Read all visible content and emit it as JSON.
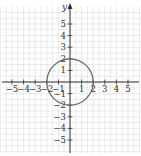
{
  "chart_data": {
    "type": "line",
    "title": "",
    "xlabel": "",
    "ylabel": "y",
    "xlim": [
      -6,
      6
    ],
    "ylim": [
      -6,
      6
    ],
    "grid": true,
    "x_ticks": [
      -5,
      -4,
      -3,
      -2,
      -1,
      1,
      2,
      3,
      4,
      5
    ],
    "y_ticks": [
      5,
      4,
      3,
      2,
      1,
      -1,
      -2,
      -3,
      -4,
      -5
    ],
    "x_tick_labels": [
      "−5",
      "−4",
      "−3",
      "−2",
      "−1",
      "1",
      "2",
      "3",
      "4",
      "5"
    ],
    "y_tick_labels": [
      "5",
      "4",
      "3",
      "2",
      "1",
      "−1",
      "−2",
      "−3",
      "−4",
      "−5"
    ],
    "series": [
      {
        "name": "circle x^2 + y^2 = 4",
        "shape": "circle",
        "center": [
          0,
          0
        ],
        "radius": 2
      }
    ],
    "legend": null
  },
  "colors": {
    "grid": "#dcdcdc",
    "axis": "#333333",
    "curve": "#666666"
  }
}
